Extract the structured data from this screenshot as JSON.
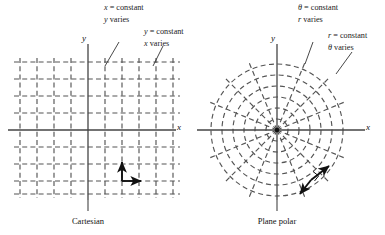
{
  "figure": {
    "background_color": "#ffffff",
    "grid_color": "#555555",
    "axis_color": "#444444",
    "ink_color": "#111111"
  },
  "panels": [
    {
      "id": "cartesian",
      "caption": "Cartesian",
      "axis_x_label": "x",
      "axis_y_label": "y",
      "annotations": [
        {
          "id": "x-constant",
          "line1_var": "x",
          "line1_rest": " = constant",
          "line2_var": "y",
          "line2_rest": " varies"
        },
        {
          "id": "y-constant",
          "line1_var": "y",
          "line1_rest": " = constant",
          "line2_var": "x",
          "line2_rest": " varies"
        }
      ],
      "grid": {
        "type": "rectangular",
        "spacing_px": 17,
        "columns": 9,
        "rows": 9,
        "dashed": true
      },
      "basis_vectors": [
        "e_x",
        "e_y"
      ]
    },
    {
      "id": "plane-polar",
      "caption": "Plane polar",
      "axis_x_label": "x",
      "axis_y_label": "y",
      "annotations": [
        {
          "id": "theta-constant",
          "line1_var": "θ",
          "line1_rest": " = constant",
          "line2_var": "r",
          "line2_rest": " varies"
        },
        {
          "id": "r-constant",
          "line1_var": "r",
          "line1_rest": " = constant",
          "line2_var": "θ",
          "line2_rest": " varies"
        }
      ],
      "grid": {
        "type": "polar",
        "circles": 6,
        "circle_radii_px": [
          11,
          22,
          33,
          44,
          55,
          66
        ],
        "spokes": 16,
        "dashed": true
      },
      "basis_vectors": [
        "e_r",
        "e_theta"
      ]
    }
  ]
}
